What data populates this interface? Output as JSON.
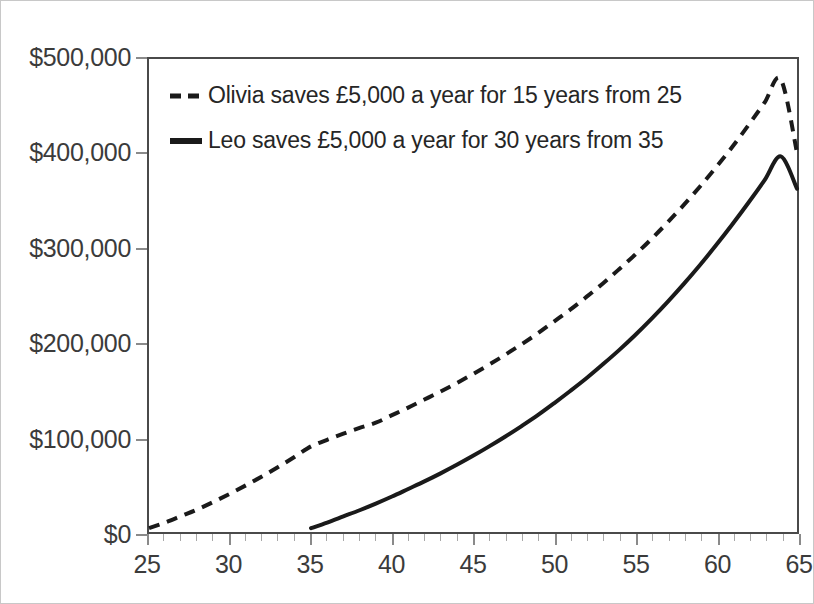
{
  "chart_data": {
    "type": "line",
    "title": "",
    "subtitle": "",
    "xlabel": "",
    "ylabel": "",
    "xlim": [
      25,
      65
    ],
    "ylim": [
      0,
      500000
    ],
    "grid": false,
    "legend_position": "top-left",
    "currency_axis_symbol": "$",
    "x_tick_labels": [
      "25",
      "30",
      "35",
      "40",
      "45",
      "50",
      "55",
      "60",
      "65"
    ],
    "x_tick_values": [
      25,
      30,
      35,
      40,
      45,
      50,
      55,
      60,
      65
    ],
    "x_minor_tick_step": 1,
    "y_tick_labels": [
      "$0",
      "$100,000",
      "$200,000",
      "$300,000",
      "$400,000",
      "$500,000"
    ],
    "y_tick_values": [
      0,
      100000,
      200000,
      300000,
      400000,
      500000
    ],
    "x": [
      25,
      26,
      27,
      28,
      29,
      30,
      31,
      32,
      33,
      34,
      35,
      36,
      37,
      38,
      39,
      40,
      41,
      42,
      43,
      44,
      45,
      46,
      47,
      48,
      49,
      50,
      51,
      52,
      53,
      54,
      55,
      56,
      57,
      58,
      59,
      60,
      61,
      62,
      63,
      64,
      65
    ],
    "series": [
      {
        "name": "Olivia saves £5,000 a year for 15 years from 25",
        "label": "Olivia saves £5,000 a year for 15 years from 25",
        "style": "dashed",
        "color": "#1a1a1a",
        "start_age": 25,
        "contribution": 5000,
        "contribution_years": 15,
        "final_value": 401000,
        "values": [
          5000,
          10350,
          16075,
          22200,
          28755,
          35768,
          43271,
          51300,
          59891,
          69083,
          78919,
          89443,
          100704,
          112753,
          125646,
          134441,
          143852,
          153921,
          164696,
          176225,
          188561,
          201760,
          215883,
          230995,
          247165,
          264467,
          282980,
          302789,
          323984,
          346663,
          370929,
          396894,
          424677,
          454404,
          486213,
          520248,
          556665,
          595632,
          637326,
          681939,
          729675
        ]
      },
      {
        "name": "Leo saves £5,000 a year for 30 years from 35",
        "label": "Leo saves £5,000 a year for 30 years from 35",
        "style": "solid",
        "color": "#1a1a1a",
        "start_age": 35,
        "contribution": 5000,
        "contribution_years": 30,
        "final_value": 363000,
        "values": [
          null,
          null,
          null,
          null,
          null,
          null,
          null,
          null,
          null,
          null,
          5000,
          10350,
          16075,
          22200,
          28755,
          35768,
          43271,
          51300,
          59891,
          69083,
          78919,
          89443,
          100704,
          112753,
          125646,
          139441,
          154202,
          169996,
          186896,
          204979,
          224328,
          245031,
          267183,
          290886,
          316248,
          343386,
          372423,
          403493,
          436738,
          472309,
          510371
        ]
      }
    ],
    "plot_series_rendered": [
      {
        "name": "olivia",
        "points": [
          [
            25,
            4000
          ],
          [
            26,
            10000
          ],
          [
            27,
            17000
          ],
          [
            28,
            24000
          ],
          [
            29,
            32000
          ],
          [
            30,
            40500
          ],
          [
            31,
            49500
          ],
          [
            32,
            59000
          ],
          [
            33,
            69000
          ],
          [
            34,
            79500
          ],
          [
            35,
            90500
          ],
          [
            36,
            97500
          ],
          [
            37,
            104000
          ],
          [
            38,
            110000
          ],
          [
            39,
            115500
          ],
          [
            40,
            123500
          ],
          [
            41,
            131500
          ],
          [
            42,
            140000
          ],
          [
            43,
            148500
          ],
          [
            44,
            157500
          ],
          [
            45,
            167000
          ],
          [
            46,
            177000
          ],
          [
            47,
            187500
          ],
          [
            48,
            198500
          ],
          [
            49,
            210000
          ],
          [
            50,
            222500
          ],
          [
            51,
            235000
          ],
          [
            52,
            248500
          ],
          [
            53,
            262500
          ],
          [
            54,
            277500
          ],
          [
            55,
            293000
          ],
          [
            56,
            309500
          ],
          [
            57,
            327000
          ],
          [
            58,
            345500
          ],
          [
            59,
            365000
          ],
          [
            60,
            385500
          ],
          [
            61,
            407000
          ],
          [
            62,
            430000
          ],
          [
            63,
            454000
          ],
          [
            64,
            478500
          ],
          [
            65,
            401000
          ]
        ]
      },
      {
        "name": "leo",
        "points": [
          [
            35,
            4000
          ],
          [
            36,
            10000
          ],
          [
            37,
            16500
          ],
          [
            38,
            23000
          ],
          [
            39,
            30000
          ],
          [
            40,
            37500
          ],
          [
            41,
            45500
          ],
          [
            42,
            53500
          ],
          [
            43,
            62000
          ],
          [
            44,
            71000
          ],
          [
            45,
            80500
          ],
          [
            46,
            90500
          ],
          [
            47,
            101000
          ],
          [
            48,
            112000
          ],
          [
            49,
            123500
          ],
          [
            50,
            136000
          ],
          [
            51,
            149000
          ],
          [
            52,
            162500
          ],
          [
            53,
            177000
          ],
          [
            54,
            192000
          ],
          [
            55,
            208000
          ],
          [
            56,
            225000
          ],
          [
            57,
            243000
          ],
          [
            58,
            262000
          ],
          [
            59,
            282000
          ],
          [
            60,
            303000
          ],
          [
            61,
            325000
          ],
          [
            62,
            348000
          ],
          [
            63,
            372000
          ],
          [
            64,
            397000
          ],
          [
            65,
            363000
          ]
        ]
      }
    ]
  },
  "legend": {
    "entries": [
      {
        "marker": "dashed-line-swatch",
        "label": "Olivia saves £5,000 a year for 15 years from 25"
      },
      {
        "marker": "solid-line-swatch",
        "label": "Leo saves £5,000 a year for 30 years from 35"
      }
    ]
  },
  "colors": {
    "series_line": "#1a1a1a",
    "axis": "#4a4a4a",
    "tick": "#8a8a8a",
    "text": "#3b3b3b",
    "background": "#ffffff",
    "figure_border": "#c8c8c8"
  }
}
